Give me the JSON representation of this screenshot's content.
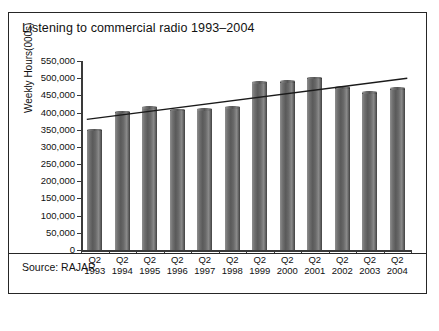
{
  "figure": {
    "title": "Listening to commercial radio 1993–2004",
    "source": "Source: RAJAR"
  },
  "chart_data": {
    "type": "bar",
    "title": "Listening to commercial radio 1993–2004",
    "xlabel": "",
    "ylabel": "Weekly Hours(000s)",
    "categories": [
      "Q2 1993",
      "Q2 1994",
      "Q2 1995",
      "Q2 1996",
      "Q2 1997",
      "Q2 1998",
      "Q2 1999",
      "Q2 2000",
      "Q2 2001",
      "Q2 2002",
      "Q2 2003",
      "Q2 2004"
    ],
    "quarter_labels": [
      "Q2",
      "Q2",
      "Q2",
      "Q2",
      "Q2",
      "Q2",
      "Q2",
      "Q2",
      "Q2",
      "Q2",
      "Q2",
      "Q2"
    ],
    "year_labels": [
      "1993",
      "1994",
      "1995",
      "1996",
      "1997",
      "1998",
      "1999",
      "2000",
      "2001",
      "2002",
      "2003",
      "2004"
    ],
    "values": [
      346000,
      398000,
      412000,
      404000,
      406000,
      412000,
      485000,
      487000,
      498000,
      470000,
      455000,
      467000
    ],
    "ylim": [
      0,
      550000
    ],
    "ytick_values": [
      0,
      50000,
      100000,
      150000,
      200000,
      250000,
      300000,
      350000,
      400000,
      450000,
      500000,
      550000
    ],
    "ytick_labels": [
      "0",
      "50,000",
      "100,000",
      "150,000",
      "200,000",
      "250,000",
      "300,000",
      "350,000",
      "400,000",
      "450,000",
      "500,000",
      "550,000"
    ],
    "grid": false,
    "legend": "none",
    "series": [
      {
        "name": "Weekly Hours",
        "values": [
          346000,
          398000,
          412000,
          404000,
          406000,
          412000,
          485000,
          487000,
          498000,
          470000,
          455000,
          467000
        ]
      },
      {
        "name": "Trend line",
        "type": "line",
        "start_value": 380000,
        "end_value": 500000
      }
    ],
    "bar_color": "#6b6b6b",
    "trendline_color": "#1a1a1a"
  }
}
